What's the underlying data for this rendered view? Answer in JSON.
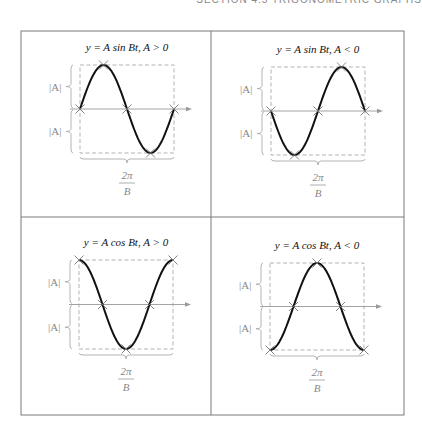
{
  "header": {
    "text": "SECTION 4.5  TRIGONOMETRIC GRAPHS"
  },
  "amplitude_label": "|A|",
  "period_label": {
    "numerator": "2π",
    "denominator": "B"
  },
  "panels": [
    {
      "id": "sin-pos",
      "title": "y = A sin Bt, A > 0",
      "func": "sin",
      "sign": 1,
      "box": {
        "x": 80,
        "y": 65,
        "w": 94,
        "h": 88
      }
    },
    {
      "id": "sin-neg",
      "title": "y = A sin Bt, A < 0",
      "func": "sin",
      "sign": -1,
      "box": {
        "x": 271,
        "y": 67,
        "w": 94,
        "h": 88
      }
    },
    {
      "id": "cos-pos",
      "title": "y = A cos Bt, A > 0",
      "func": "cos",
      "sign": 1,
      "box": {
        "x": 79,
        "y": 260,
        "w": 94,
        "h": 89
      }
    },
    {
      "id": "cos-neg",
      "title": "y = A cos Bt, A < 0",
      "func": "cos",
      "sign": -1,
      "box": {
        "x": 270,
        "y": 263,
        "w": 94,
        "h": 87
      }
    }
  ],
  "frame": {
    "left": 21,
    "top": 31,
    "right": 404,
    "bottom": 415,
    "midx": 211,
    "midy": 217
  },
  "chart_data": [
    {
      "type": "line",
      "title": "y = A sin Bt, A > 0",
      "x": [
        "0",
        "π/2B",
        "π/B",
        "3π/2B",
        "2π/B"
      ],
      "values": [
        0,
        1,
        0,
        -1,
        0
      ],
      "annotations": [
        "|A| above axis",
        "|A| below axis",
        "period 2π/B"
      ]
    },
    {
      "type": "line",
      "title": "y = A sin Bt, A < 0",
      "x": [
        "0",
        "π/2B",
        "π/B",
        "3π/2B",
        "2π/B"
      ],
      "values": [
        0,
        -1,
        0,
        1,
        0
      ],
      "annotations": [
        "|A| above axis",
        "|A| below axis",
        "period 2π/B"
      ]
    },
    {
      "type": "line",
      "title": "y = A cos Bt, A > 0",
      "x": [
        "0",
        "π/2B",
        "π/B",
        "3π/2B",
        "2π/B"
      ],
      "values": [
        1,
        0,
        -1,
        0,
        1
      ],
      "annotations": [
        "|A| above axis",
        "|A| below axis",
        "period 2π/B"
      ]
    },
    {
      "type": "line",
      "title": "y = A cos Bt, A < 0",
      "x": [
        "0",
        "π/2B",
        "π/B",
        "3π/2B",
        "2π/B"
      ],
      "values": [
        -1,
        0,
        1,
        0,
        -1
      ],
      "annotations": [
        "|A| above axis",
        "|A| below axis",
        "period 2π/B"
      ]
    }
  ]
}
